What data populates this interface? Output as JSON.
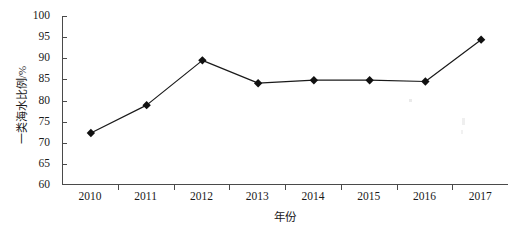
{
  "chart_data": {
    "type": "line",
    "title": "",
    "xlabel": "年份",
    "ylabel": "一类海水比例/%",
    "categories": [
      "2010",
      "2011",
      "2012",
      "2013",
      "2014",
      "2015",
      "2016",
      "2017"
    ],
    "values": [
      72.3,
      78.9,
      89.5,
      84.1,
      84.8,
      84.8,
      84.5,
      94.4
    ],
    "series": [
      {
        "name": "一类海水比例",
        "values": [
          72.3,
          78.9,
          89.5,
          84.1,
          84.8,
          84.8,
          84.5,
          94.4
        ]
      }
    ],
    "ylim": [
      60,
      100
    ],
    "yticks": [
      60,
      65,
      70,
      75,
      80,
      85,
      90,
      95,
      100
    ],
    "ytick_labels": [
      "60",
      "65",
      "70",
      "75",
      "80",
      "85",
      "90",
      "95",
      "100"
    ],
    "grid": false,
    "legend": false,
    "legend_position": "none",
    "marker": "diamond",
    "line_color": "#1a1a1a",
    "marker_color": "#111111",
    "axis_color": "#4a4a4a",
    "background_color": "#ffffff"
  }
}
